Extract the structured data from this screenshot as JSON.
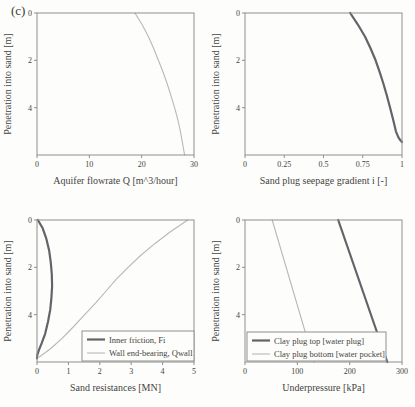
{
  "figure": {
    "panel_label": "(c)",
    "background_color": "#fdfdfb",
    "axis_color": "#8f8f8f",
    "text_color": "#45443f"
  },
  "chart_data": [
    {
      "type": "line",
      "title": "",
      "xlabel": "Aquifer flowrate Q [m^3/hour]",
      "ylabel": "Penetration into sand [m]",
      "xlim": [
        0,
        30
      ],
      "ylim": [
        0,
        6
      ],
      "y_inverted": true,
      "grid": false,
      "xticks": [
        0,
        10,
        20,
        30
      ],
      "xtick_labels": [
        "0",
        "10",
        "20",
        "30"
      ],
      "yticks": [
        0,
        2,
        4
      ],
      "ytick_labels": [
        "0",
        "2",
        "4"
      ],
      "legend": null,
      "series": [
        {
          "name": "Aquifer flowrate Q",
          "color": "#b9b9b3",
          "width": 1.1,
          "points": [
            [
              18.7,
              0
            ],
            [
              20.1,
              0.5
            ],
            [
              21.3,
              1
            ],
            [
              22.3,
              1.5
            ],
            [
              23.2,
              2
            ],
            [
              24.1,
              2.5
            ],
            [
              24.9,
              3
            ],
            [
              25.6,
              3.5
            ],
            [
              26.3,
              4
            ],
            [
              26.9,
              4.5
            ],
            [
              27.4,
              5
            ],
            [
              27.8,
              5.5
            ],
            [
              28.2,
              6
            ]
          ]
        }
      ]
    },
    {
      "type": "line",
      "title": "",
      "xlabel": "Sand plug seepage gradient i [-]",
      "ylabel": "Penetration into sand [m]",
      "xlim": [
        0,
        1
      ],
      "ylim": [
        0,
        6
      ],
      "y_inverted": true,
      "grid": false,
      "xticks": [
        0,
        0.25,
        0.5,
        0.75,
        1
      ],
      "xtick_labels": [
        "0",
        "0.25",
        "0.5",
        "0.75",
        "1"
      ],
      "yticks": [
        0,
        2,
        4
      ],
      "ytick_labels": [
        "0",
        "2",
        "4"
      ],
      "legend": null,
      "series": [
        {
          "name": "Sand plug seepage gradient i",
          "color": "#63636a",
          "width": 2.2,
          "points": [
            [
              0.67,
              0
            ],
            [
              0.72,
              0.5
            ],
            [
              0.765,
              1
            ],
            [
              0.8,
              1.5
            ],
            [
              0.832,
              2
            ],
            [
              0.858,
              2.5
            ],
            [
              0.882,
              3
            ],
            [
              0.904,
              3.5
            ],
            [
              0.924,
              4
            ],
            [
              0.943,
              4.5
            ],
            [
              0.961,
              5
            ],
            [
              0.977,
              5.25
            ],
            [
              0.99,
              5.38
            ],
            [
              1.0,
              5.45
            ]
          ]
        }
      ]
    },
    {
      "type": "line",
      "title": "",
      "xlabel": "Sand resistances [MN]",
      "ylabel": "Penetration into sand [m]",
      "xlim": [
        0,
        5
      ],
      "ylim": [
        0,
        6
      ],
      "y_inverted": true,
      "grid": false,
      "xticks": [
        0,
        1,
        2,
        3,
        4,
        5
      ],
      "xtick_labels": [
        "0",
        "1",
        "2",
        "3",
        "4",
        "5"
      ],
      "yticks": [
        0,
        2,
        4
      ],
      "ytick_labels": [
        "0",
        "2",
        "4"
      ],
      "legend": {
        "position": "bottom-right",
        "x": 82,
        "y": 124,
        "w": 112,
        "h": 30
      },
      "series": [
        {
          "name": "Inner friction, Fi",
          "color": "#63636a",
          "width": 2.2,
          "points": [
            [
              0.03,
              0
            ],
            [
              0.18,
              0.35
            ],
            [
              0.3,
              0.8
            ],
            [
              0.39,
              1.3
            ],
            [
              0.44,
              1.8
            ],
            [
              0.47,
              2.3
            ],
            [
              0.48,
              2.8
            ],
            [
              0.46,
              3.3
            ],
            [
              0.42,
              3.8
            ],
            [
              0.35,
              4.3
            ],
            [
              0.26,
              4.8
            ],
            [
              0.15,
              5.2
            ],
            [
              0.06,
              5.5
            ],
            [
              0.01,
              5.7
            ],
            [
              0.0,
              5.85
            ]
          ]
        },
        {
          "name": "Wall end-bearing, Qwall",
          "color": "#b9b9b3",
          "width": 1.1,
          "points": [
            [
              4.8,
              0
            ],
            [
              4.25,
              0.5
            ],
            [
              3.75,
              1
            ],
            [
              3.3,
              1.5
            ],
            [
              2.9,
              2
            ],
            [
              2.53,
              2.5
            ],
            [
              2.2,
              3
            ],
            [
              1.87,
              3.5
            ],
            [
              1.52,
              4
            ],
            [
              1.17,
              4.5
            ],
            [
              0.8,
              5
            ],
            [
              0.42,
              5.45
            ],
            [
              0.06,
              5.8
            ]
          ]
        }
      ]
    },
    {
      "type": "line",
      "title": "",
      "xlabel": "Underpressure [kPa]",
      "ylabel": "Penetration into sand [m]",
      "xlim": [
        0,
        300
      ],
      "ylim": [
        0,
        6
      ],
      "y_inverted": true,
      "grid": false,
      "xticks": [
        0,
        100,
        200,
        300
      ],
      "xtick_labels": [
        "0",
        "100",
        "200",
        "300"
      ],
      "yticks": [
        0,
        2,
        4
      ],
      "ytick_labels": [
        "0",
        "2",
        "4"
      ],
      "legend": {
        "position": "bottom-left",
        "x": 39,
        "y": 125,
        "w": 139,
        "h": 29
      },
      "series": [
        {
          "name": "Clay plug top [water plug]",
          "color": "#63636a",
          "width": 2.2,
          "points": [
            [
              178,
              0
            ],
            [
              272,
              6
            ]
          ]
        },
        {
          "name": "Clay plug bottom [water pocket]",
          "color": "#b9b9b3",
          "width": 1.1,
          "points": [
            [
              52,
              0
            ],
            [
              132,
              6
            ]
          ]
        }
      ]
    }
  ]
}
